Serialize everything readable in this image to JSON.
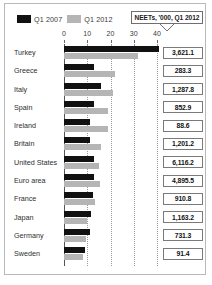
{
  "legend": {
    "entries": [
      {
        "label": "Q1 2007",
        "color": "#111111",
        "icon": "legend-swatch-dark"
      },
      {
        "label": "Q1 2012",
        "color": "#b5b5b5",
        "icon": "legend-swatch-light"
      }
    ]
  },
  "callout": {
    "text": "NEETs, '000, Q1 2012"
  },
  "axis": {
    "ticks": [
      "0",
      "10",
      "20",
      "30",
      "40"
    ],
    "min": 0,
    "max": 40
  },
  "chart_data": {
    "type": "bar",
    "orientation": "horizontal",
    "title": "",
    "subtitle": "",
    "xlabel": "",
    "ylabel": "",
    "xlim": [
      0,
      40
    ],
    "grid": true,
    "legend_position": "top-left",
    "annotation": "NEETs, '000, Q1 2012",
    "categories": [
      "Turkey",
      "Greece",
      "Italy",
      "Spain",
      "Ireland",
      "Britain",
      "United States",
      "Euro area",
      "France",
      "Japan",
      "Germany",
      "Sweden"
    ],
    "series": [
      {
        "name": "Q1 2007",
        "color": "#111111",
        "values": [
          41.0,
          13.0,
          16.0,
          13.0,
          11.0,
          11.0,
          13.0,
          13.0,
          12.5,
          11.5,
          11.0,
          9.0
        ]
      },
      {
        "name": "Q1 2012",
        "color": "#b5b5b5",
        "values": [
          32.0,
          22.0,
          21.0,
          19.0,
          19.0,
          16.0,
          15.0,
          15.5,
          13.5,
          10.0,
          9.5,
          8.0
        ]
      }
    ],
    "data_labels": {
      "name": "NEETs, '000, Q1 2012",
      "values": [
        "3,621.1",
        "283.3",
        "1,287.8",
        "852.9",
        "88.6",
        "1,201.2",
        "6,116.2",
        "4,895.5",
        "910.8",
        "1,163.2",
        "731.3",
        "91.4"
      ]
    }
  }
}
